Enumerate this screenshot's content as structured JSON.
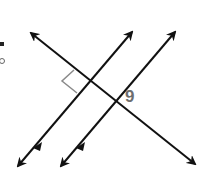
{
  "diagram": {
    "type": "geometry-lines",
    "angle_label": "9",
    "colors": {
      "lines": "#111111",
      "right_angle_mark": "#8a8a8a",
      "label": "#6e6e6e",
      "background": "#ffffff"
    },
    "lines": [
      {
        "id": "transversal",
        "from": [
          30,
          32
        ],
        "to": [
          196,
          165
        ],
        "arrows": "both"
      },
      {
        "id": "parallel-1",
        "from": [
          17,
          167
        ],
        "to": [
          133,
          31
        ],
        "arrows": "both"
      },
      {
        "id": "parallel-2",
        "from": [
          60,
          167
        ],
        "to": [
          176,
          31
        ],
        "arrows": "both"
      }
    ],
    "right_angle_at": [
      89,
      80
    ]
  }
}
